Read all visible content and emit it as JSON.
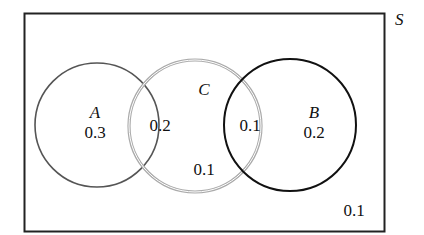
{
  "diagram": {
    "type": "venn",
    "universe": {
      "label": "S",
      "outside_value": "0.1"
    },
    "sets": [
      {
        "name": "A",
        "label": "A",
        "only_value": "0.3",
        "stroke": "#555555"
      },
      {
        "name": "C",
        "label": "C",
        "only_value": "0.1",
        "stroke": "#9a9a9a"
      },
      {
        "name": "B",
        "label": "B",
        "only_value": "0.2",
        "stroke": "#111111"
      }
    ],
    "intersections": [
      {
        "sets": [
          "A",
          "C"
        ],
        "value": "0.2"
      },
      {
        "sets": [
          "C",
          "B"
        ],
        "value": "0.1"
      }
    ]
  }
}
